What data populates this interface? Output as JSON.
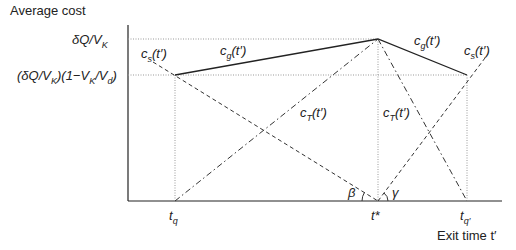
{
  "diagram": {
    "y_axis_label": "Average cost",
    "x_axis_label": "Exit time t′",
    "y_ticks": [
      {
        "label": "δQ/V_K",
        "text_main": "δQ/V",
        "text_sub": "K"
      },
      {
        "label": "(δQ/V_K)(1−V_K/V_d)",
        "part1": "(δQ/V",
        "sub1": "K",
        "part2": ")(1−V",
        "sub2": "K",
        "part3": "/V",
        "sub3": "d",
        "part4": ")"
      }
    ],
    "x_ticks": [
      {
        "label": "t_q",
        "main": "t",
        "sub": "q"
      },
      {
        "label": "t*",
        "main": "t*"
      },
      {
        "label": "t_q′",
        "main": "t",
        "sub": "q′"
      }
    ],
    "curve_labels": {
      "cs_left": {
        "main": "c",
        "sub": "s",
        "arg": "(t′)"
      },
      "cg_left": {
        "main": "c",
        "sub": "g",
        "arg": "(t′)"
      },
      "cT_left": {
        "main": "c",
        "sub": "T",
        "arg": "(t′)"
      },
      "cT_right": {
        "main": "c",
        "sub": "T",
        "arg": "(t′)"
      },
      "cg_right": {
        "main": "c",
        "sub": "g",
        "arg": "(t′)"
      },
      "cs_right": {
        "main": "c",
        "sub": "s",
        "arg": "(t′)"
      }
    },
    "angles": {
      "beta": "β",
      "gamma": "γ"
    },
    "line_color": "#222222",
    "guide_color": "#999999"
  }
}
